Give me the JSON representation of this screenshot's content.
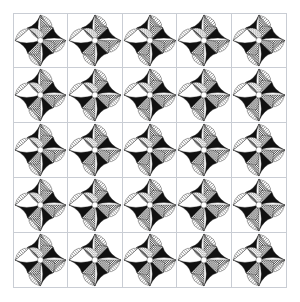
{
  "artwork": {
    "title": "Tessellated Quilt Block Pattern",
    "background_color": "#ffffff",
    "frame": {
      "border_color": "#c9cdd4",
      "x": 13,
      "y": 13,
      "width": 274,
      "height": 275
    },
    "grid": {
      "columns": 5,
      "rows": 5,
      "tile_count": 25,
      "tile_border_color": "#c9cdd4"
    },
    "tile": {
      "name": "four-point-star-pinwheel",
      "description": "Four-quadrant pinwheel forming a four pointed star with black, hatched, checkered and gray facets around a white center",
      "quadrant_count": 4,
      "symmetry": "4-fold rotational"
    },
    "palette": {
      "black": "#111111",
      "dark_gray": "#4a4a4a",
      "mid_gray": "#8c8c8c",
      "light_gray": "#c0c0c0",
      "pale_gray": "#e2e2e2",
      "white": "#ffffff",
      "line": "#2b2b2b",
      "tile_border": "#c9cdd4"
    },
    "textures": [
      "solid-black",
      "diagonal-hatch-dense",
      "diagonal-hatch-light",
      "checkerboard",
      "cross-hatch",
      "solid-white"
    ]
  }
}
